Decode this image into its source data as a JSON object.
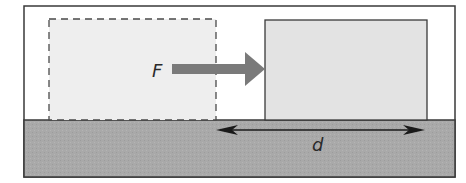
{
  "diagram": {
    "force_label": "F",
    "displacement_label": "d",
    "elements": {
      "initial_block": "dashed outline (initial position)",
      "final_block": "solid outline (final position)",
      "force_arrow": "points right toward final block",
      "displacement_arrow": "double-headed, spans block travel distance"
    },
    "colors": {
      "frame": "#3a3a3a",
      "ground": "#a9a9a9",
      "block_fill": "#e3e3e3",
      "ghost_fill": "#eeeeee",
      "force_arrow": "#7a7a7a",
      "displacement_arrow": "#1a1a1a"
    }
  }
}
